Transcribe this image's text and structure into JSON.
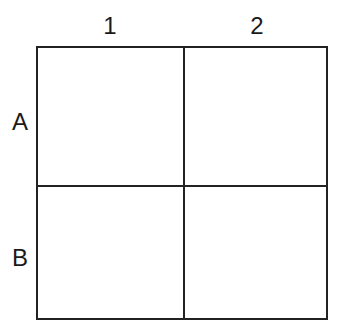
{
  "columns": [
    {
      "label": "1"
    },
    {
      "label": "2"
    }
  ],
  "rows": [
    {
      "label": "A"
    },
    {
      "label": "B"
    }
  ],
  "cells": [
    [
      "",
      ""
    ],
    [
      "",
      ""
    ]
  ]
}
